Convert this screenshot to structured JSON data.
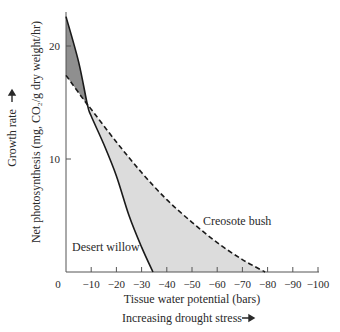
{
  "chart_data": {
    "type": "line",
    "title": "",
    "xlabel": "Tissue water potential (bars)",
    "xlabel_secondary": "Increasing drought stress",
    "ylabel": "Net photosynthesis (mg, CO₂/g dry weight/hr)",
    "ylabel_secondary": "Growth rate",
    "x_ticks": [
      "0",
      "−10",
      "−20",
      "−30",
      "−40",
      "−50",
      "−60",
      "−70",
      "−80",
      "−90",
      "−100"
    ],
    "y_ticks": [
      "10",
      "20"
    ],
    "xlim": [
      0,
      -100
    ],
    "ylim": [
      0,
      23
    ],
    "grid": false,
    "legend": "inline labels",
    "series": [
      {
        "name": "Desert willow",
        "style": "solid",
        "x": [
          0,
          -5,
          -8.5,
          -10,
          -15,
          -20,
          -25,
          -30,
          -34.5
        ],
        "values": [
          22.6,
          18.6,
          14.8,
          13.8,
          11.3,
          8.5,
          5.0,
          2.2,
          0
        ]
      },
      {
        "name": "Creosote bush",
        "style": "dashed",
        "x": [
          0,
          -8.5,
          -10,
          -20,
          -30,
          -40,
          -50,
          -60,
          -70,
          -79
        ],
        "values": [
          17.4,
          14.8,
          14.4,
          11.5,
          8.8,
          6.4,
          4.4,
          2.6,
          1.1,
          0
        ]
      }
    ],
    "shaded_regions": [
      {
        "description": "Desert willow above Creosote bush",
        "x_range": [
          0,
          -8.5
        ],
        "color": "#8f8f8f"
      },
      {
        "description": "Creosote bush above Desert willow",
        "x_range": [
          -8.5,
          -79
        ],
        "color": "#dcdcdc"
      }
    ]
  },
  "labels": {
    "desert_willow": "Desert willow",
    "creosote_bush": "Creosote bush",
    "x_title": "Tissue water potential (bars)",
    "x_subtitle": "Increasing drought stress",
    "y_title": "Net photosynthesis (mg, CO₂/g dry weight/hr)",
    "y_subtitle": "Growth rate",
    "arrow": "→"
  },
  "colors": {
    "dark_fill": "#8f8f8f",
    "light_fill": "#dcdcdc",
    "line": "#1a1a1a",
    "axis": "#555555"
  }
}
